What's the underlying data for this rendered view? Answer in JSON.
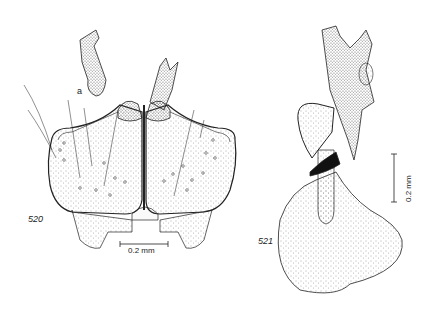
{
  "figures": [
    {
      "number": "520",
      "sublabel": "a",
      "scale_bar": "0.2 mm",
      "scale_orientation": "horizontal"
    },
    {
      "number": "521",
      "scale_bar": "0.2 mm",
      "scale_orientation": "vertical"
    }
  ],
  "colors": {
    "ink": "#222222",
    "stipple": "#555555",
    "background": "#ffffff"
  }
}
